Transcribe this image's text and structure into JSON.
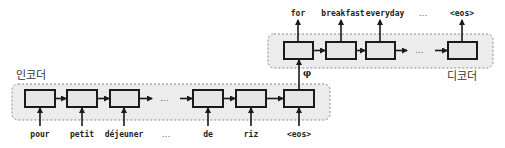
{
  "encoder": {
    "label": "인코더",
    "inputs": [
      "pour",
      "petit",
      "déjeuner",
      "...",
      "de",
      "riz",
      "<eos>"
    ],
    "ellipsis": "..."
  },
  "decoder": {
    "label": "디코더",
    "outputs": [
      "for",
      "breakfast",
      "everyday",
      "...",
      "<eos>"
    ],
    "ellipsis": "..."
  },
  "context_vector": "φ",
  "colors": {
    "region_fill": "#ececec",
    "cell_fill": "#e6e6e6",
    "stroke": "#1a1a1a"
  }
}
